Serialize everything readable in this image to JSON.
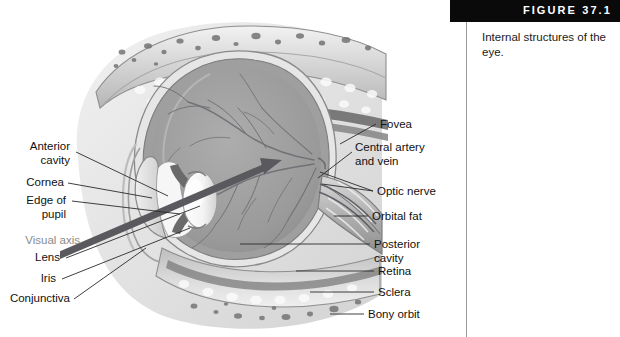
{
  "figure": {
    "number_label": "FIGURE 37.1",
    "caption": "Internal structures\nof the eye.",
    "accent_bar_color": "#0a0a0a",
    "divider_color": "#9a9a9a"
  },
  "illustration": {
    "name": "eye-sagittal-cross-section",
    "style": "grayscale anatomical cross-section",
    "visual_axis_color": "#5a5a5e"
  },
  "labels_left": [
    {
      "id": "anterior-cavity",
      "text": "Anterior\ncavity",
      "x": 20,
      "y": 140
    },
    {
      "id": "cornea",
      "text": "Cornea",
      "x": 26,
      "y": 176
    },
    {
      "id": "edge-of-pupil",
      "text": "Edge of\npupil",
      "x": 14,
      "y": 194
    },
    {
      "id": "visual-axis",
      "text": "Visual axis",
      "x": 12,
      "y": 234,
      "muted": true
    },
    {
      "id": "lens",
      "text": "Lens",
      "x": 34,
      "y": 256
    },
    {
      "id": "iris",
      "text": "Iris",
      "x": 43,
      "y": 276
    },
    {
      "id": "conjunctiva",
      "text": "Conjunctiva",
      "x": 8,
      "y": 296
    }
  ],
  "labels_right": [
    {
      "id": "fovea",
      "text": "Fovea",
      "x": 380,
      "y": 120
    },
    {
      "id": "central-artery-vein",
      "text": "Central artery\nand vein",
      "x": 355,
      "y": 143
    },
    {
      "id": "optic-nerve",
      "text": "Optic nerve",
      "x": 377,
      "y": 188
    },
    {
      "id": "orbital-fat",
      "text": "Orbital fat",
      "x": 372,
      "y": 213
    },
    {
      "id": "posterior-cavity",
      "text": "Posterior\ncavity",
      "x": 374,
      "y": 240
    },
    {
      "id": "retina",
      "text": "Retina",
      "x": 378,
      "y": 268
    },
    {
      "id": "sclera",
      "text": "Sclera",
      "x": 378,
      "y": 289
    },
    {
      "id": "bony-orbit",
      "text": "Bony orbit",
      "x": 368,
      "y": 311
    }
  ]
}
